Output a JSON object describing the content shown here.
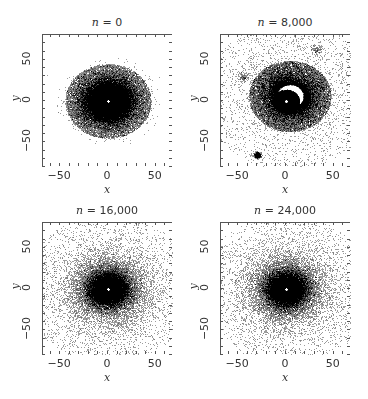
{
  "figure": {
    "width": 368,
    "height": 399,
    "frame_color": "#555555",
    "point_color": "#000000",
    "background": "#ffffff"
  },
  "chart_data": [
    {
      "type": "scatter",
      "title": "n = 0",
      "title_var": "n",
      "title_value": "0",
      "xlabel": "x",
      "ylabel": "y",
      "xlim": [
        -68,
        68
      ],
      "ylim": [
        -80,
        80
      ],
      "xticks": [
        -50,
        0,
        50
      ],
      "yticks": [
        -50,
        0,
        50
      ],
      "minor_tick_step": 10,
      "grid": false,
      "distribution": {
        "kind": "radial",
        "core_radius": 15,
        "extent": 45,
        "density": "high",
        "central_hole": true
      },
      "satellites": []
    },
    {
      "type": "scatter",
      "title": "n = 8,000",
      "title_var": "n",
      "title_value": "8,000",
      "xlabel": "x",
      "ylabel": "y",
      "xlim": [
        -68,
        68
      ],
      "ylim": [
        -80,
        80
      ],
      "xticks": [
        -50,
        0,
        50
      ],
      "yticks": [
        -50,
        0,
        50
      ],
      "minor_tick_step": 10,
      "grid": false,
      "distribution": {
        "kind": "spiral-halo",
        "core_radius": 12,
        "extent": 40,
        "density": "medium",
        "central_hole": true
      },
      "satellites": [
        {
          "x": -30,
          "y": -65,
          "size": "small-dense"
        },
        {
          "x": -45,
          "y": 30,
          "size": "faint"
        },
        {
          "x": 32,
          "y": 62,
          "size": "faint"
        }
      ]
    },
    {
      "type": "scatter",
      "title": "n = 16,000",
      "title_var": "n",
      "title_value": "16,000",
      "xlabel": "x",
      "ylabel": "y",
      "xlim": [
        -68,
        68
      ],
      "ylim": [
        -80,
        80
      ],
      "xticks": [
        -50,
        0,
        50
      ],
      "yticks": [
        -50,
        0,
        50
      ],
      "minor_tick_step": 10,
      "grid": false,
      "distribution": {
        "kind": "radial-diffuse",
        "core_radius": 12,
        "extent": 55,
        "density": "medium",
        "central_hole": true
      },
      "satellites": []
    },
    {
      "type": "scatter",
      "title": "n = 24,000",
      "title_var": "n",
      "title_value": "24,000",
      "xlabel": "x",
      "ylabel": "y",
      "xlim": [
        -68,
        68
      ],
      "ylim": [
        -80,
        80
      ],
      "xticks": [
        -50,
        0,
        50
      ],
      "yticks": [
        -50,
        0,
        50
      ],
      "minor_tick_step": 10,
      "grid": false,
      "distribution": {
        "kind": "radial-diffuse",
        "core_radius": 12,
        "extent": 55,
        "density": "medium",
        "central_hole": true
      },
      "satellites": []
    }
  ],
  "layout": {
    "panels": [
      {
        "frame": {
          "left": 42,
          "top": 34,
          "width": 130,
          "height": 132
        }
      },
      {
        "frame": {
          "left": 220,
          "top": 34,
          "width": 130,
          "height": 132
        }
      },
      {
        "frame": {
          "left": 42,
          "top": 222,
          "width": 130,
          "height": 132
        }
      },
      {
        "frame": {
          "left": 220,
          "top": 222,
          "width": 130,
          "height": 132
        }
      }
    ]
  }
}
